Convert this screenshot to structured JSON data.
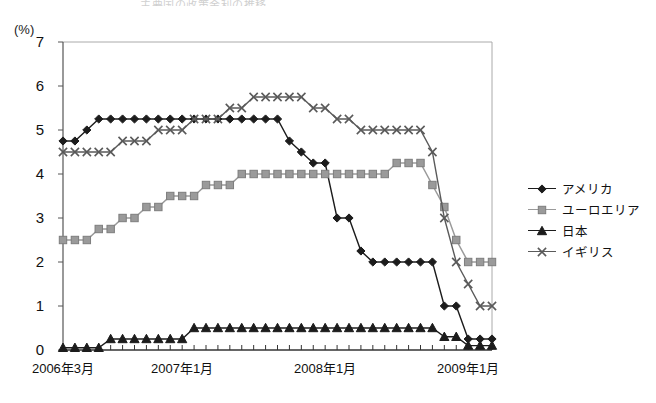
{
  "title_faint": "主要国の政策金利の推移",
  "axis": {
    "unit_label": "(%)",
    "y_ticks": [
      "0",
      "1",
      "2",
      "3",
      "4",
      "5",
      "6",
      "7"
    ],
    "x_tick_labels": [
      "2006年3月",
      "2007年1月",
      "2008年1月",
      "2009年1月"
    ]
  },
  "legend": {
    "items": [
      {
        "label": "アメリカ",
        "marker": "diamond",
        "color": "#1c1c1c"
      },
      {
        "label": "ユーロエリア",
        "marker": "square",
        "color": "#9a9a9a"
      },
      {
        "label": "日本",
        "marker": "triangle",
        "color": "#1c1c1c"
      },
      {
        "label": "イギリス",
        "marker": "cross",
        "color": "#5a5a5a"
      }
    ]
  },
  "chart_data": {
    "type": "line",
    "title": "主要国の政策金利の推移",
    "xlabel": "",
    "ylabel": "(%)",
    "ylim": [
      0,
      7
    ],
    "grid": false,
    "legend_position": "right",
    "x": [
      "2006年3月",
      "2006年4月",
      "2006年5月",
      "2006年6月",
      "2006年7月",
      "2006年8月",
      "2006年9月",
      "2006年10月",
      "2006年11月",
      "2006年12月",
      "2007年1月",
      "2007年2月",
      "2007年3月",
      "2007年4月",
      "2007年5月",
      "2007年6月",
      "2007年7月",
      "2007年8月",
      "2007年9月",
      "2007年10月",
      "2007年11月",
      "2007年12月",
      "2008年1月",
      "2008年2月",
      "2008年3月",
      "2008年4月",
      "2008年5月",
      "2008年6月",
      "2008年7月",
      "2008年8月",
      "2008年9月",
      "2008年10月",
      "2008年11月",
      "2008年12月",
      "2009年1月",
      "2009年2月",
      "2009年3月"
    ],
    "series": [
      {
        "name": "アメリカ",
        "marker": "diamond",
        "color": "#1c1c1c",
        "values": [
          4.75,
          4.75,
          5.0,
          5.25,
          5.25,
          5.25,
          5.25,
          5.25,
          5.25,
          5.25,
          5.25,
          5.25,
          5.25,
          5.25,
          5.25,
          5.25,
          5.25,
          5.25,
          5.25,
          4.75,
          4.5,
          4.25,
          4.25,
          3.0,
          3.0,
          2.25,
          2.0,
          2.0,
          2.0,
          2.0,
          2.0,
          2.0,
          1.0,
          1.0,
          0.25,
          0.25,
          0.25
        ]
      },
      {
        "name": "ユーロエリア",
        "marker": "square",
        "color": "#9a9a9a",
        "values": [
          2.5,
          2.5,
          2.5,
          2.75,
          2.75,
          3.0,
          3.0,
          3.25,
          3.25,
          3.5,
          3.5,
          3.5,
          3.75,
          3.75,
          3.75,
          4.0,
          4.0,
          4.0,
          4.0,
          4.0,
          4.0,
          4.0,
          4.0,
          4.0,
          4.0,
          4.0,
          4.0,
          4.0,
          4.25,
          4.25,
          4.25,
          3.75,
          3.25,
          2.5,
          2.0,
          2.0,
          2.0
        ]
      },
      {
        "name": "日本",
        "marker": "triangle",
        "color": "#1c1c1c",
        "values": [
          0.05,
          0.05,
          0.05,
          0.05,
          0.25,
          0.25,
          0.25,
          0.25,
          0.25,
          0.25,
          0.25,
          0.5,
          0.5,
          0.5,
          0.5,
          0.5,
          0.5,
          0.5,
          0.5,
          0.5,
          0.5,
          0.5,
          0.5,
          0.5,
          0.5,
          0.5,
          0.5,
          0.5,
          0.5,
          0.5,
          0.5,
          0.5,
          0.3,
          0.3,
          0.1,
          0.1,
          0.1
        ]
      },
      {
        "name": "イギリス",
        "marker": "cross",
        "color": "#5a5a5a",
        "values": [
          4.5,
          4.5,
          4.5,
          4.5,
          4.5,
          4.75,
          4.75,
          4.75,
          5.0,
          5.0,
          5.0,
          5.25,
          5.25,
          5.25,
          5.5,
          5.5,
          5.75,
          5.75,
          5.75,
          5.75,
          5.75,
          5.5,
          5.5,
          5.25,
          5.25,
          5.0,
          5.0,
          5.0,
          5.0,
          5.0,
          5.0,
          4.5,
          3.0,
          2.0,
          1.5,
          1.0,
          1.0
        ]
      }
    ]
  }
}
